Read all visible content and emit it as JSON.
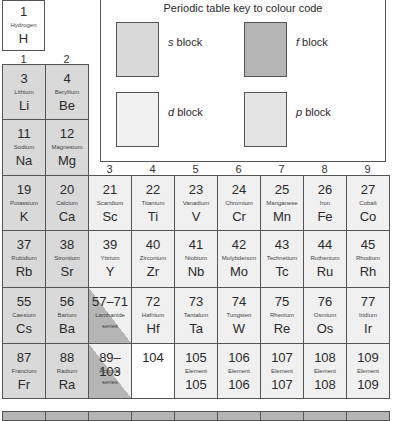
{
  "legend": {
    "title": "Periodic table key to colour code",
    "items": [
      {
        "key": "s",
        "label": " block",
        "color": "#d9d9d9"
      },
      {
        "key": "f",
        "label": " block",
        "color": "#b5b5b5"
      },
      {
        "key": "d",
        "label": " block",
        "color": "#f0f0f0"
      },
      {
        "key": "p",
        "label": " block",
        "color": "#e4e4e4"
      }
    ]
  },
  "groups": [
    "1",
    "2",
    "3",
    "4",
    "5",
    "6",
    "7",
    "8",
    "9"
  ],
  "hydrogen": {
    "num": "1",
    "name": "Hydrogen",
    "sym": "H"
  },
  "rows": {
    "r2": [
      {
        "num": "3",
        "name": "Lithium",
        "sym": "Li"
      },
      {
        "num": "4",
        "name": "Beryllium",
        "sym": "Be"
      }
    ],
    "r3": [
      {
        "num": "11",
        "name": "Sodium",
        "sym": "Na"
      },
      {
        "num": "12",
        "name": "Magnesium",
        "sym": "Mg"
      }
    ],
    "r4": [
      {
        "num": "19",
        "name": "Potassium",
        "sym": "K"
      },
      {
        "num": "20",
        "name": "Calcium",
        "sym": "Ca"
      },
      {
        "num": "21",
        "name": "Scandium",
        "sym": "Sc"
      },
      {
        "num": "22",
        "name": "Titanium",
        "sym": "Ti"
      },
      {
        "num": "23",
        "name": "Vanadium",
        "sym": "V"
      },
      {
        "num": "24",
        "name": "Chromium",
        "sym": "Cr"
      },
      {
        "num": "25",
        "name": "Manganese",
        "sym": "Mn"
      },
      {
        "num": "26",
        "name": "Iron",
        "sym": "Fe"
      },
      {
        "num": "27",
        "name": "Cobalt",
        "sym": "Co"
      }
    ],
    "r5": [
      {
        "num": "37",
        "name": "Rubidium",
        "sym": "Rb"
      },
      {
        "num": "38",
        "name": "Strontium",
        "sym": "Sr"
      },
      {
        "num": "39",
        "name": "Yttrium",
        "sym": "Y"
      },
      {
        "num": "40",
        "name": "Zirconium",
        "sym": "Zr"
      },
      {
        "num": "41",
        "name": "Niobium",
        "sym": "Nb"
      },
      {
        "num": "42",
        "name": "Molybdenum",
        "sym": "Mo"
      },
      {
        "num": "43",
        "name": "Technetium",
        "sym": "Tc"
      },
      {
        "num": "44",
        "name": "Ruthenium",
        "sym": "Ru"
      },
      {
        "num": "45",
        "name": "Rhodium",
        "sym": "Rh"
      }
    ],
    "r6": [
      {
        "num": "55",
        "name": "Caesium",
        "sym": "Cs"
      },
      {
        "num": "56",
        "name": "Barium",
        "sym": "Ba"
      },
      {
        "num": "57–71",
        "name": "Lanthanide",
        "sym": "series"
      },
      {
        "num": "72",
        "name": "Hafnium",
        "sym": "Hf"
      },
      {
        "num": "73",
        "name": "Tantalum",
        "sym": "Ta"
      },
      {
        "num": "74",
        "name": "Tungsten",
        "sym": "W"
      },
      {
        "num": "75",
        "name": "Rhenium",
        "sym": "Re"
      },
      {
        "num": "76",
        "name": "Osmium",
        "sym": "Os"
      },
      {
        "num": "77",
        "name": "Iridium",
        "sym": "Ir"
      }
    ],
    "r7": [
      {
        "num": "87",
        "name": "Francium",
        "sym": "Fr"
      },
      {
        "num": "88",
        "name": "Radium",
        "sym": "Ra"
      },
      {
        "num": "89–103",
        "name": "Actinide",
        "sym": "series"
      },
      {
        "num": "104",
        "name": "",
        "sym": ""
      },
      {
        "num": "105",
        "name": "Element",
        "sym": "105"
      },
      {
        "num": "106",
        "name": "Element",
        "sym": "106"
      },
      {
        "num": "107",
        "name": "Element",
        "sym": "107"
      },
      {
        "num": "108",
        "name": "Element",
        "sym": "108"
      },
      {
        "num": "109",
        "name": "Element",
        "sym": "109"
      }
    ]
  }
}
